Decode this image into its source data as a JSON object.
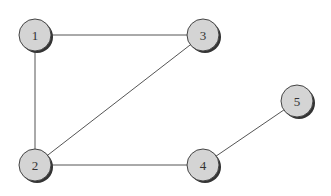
{
  "graph": {
    "nodes": [
      {
        "id": "1",
        "label": "1",
        "x": 35,
        "y": 35
      },
      {
        "id": "2",
        "label": "2",
        "x": 35,
        "y": 165
      },
      {
        "id": "3",
        "label": "3",
        "x": 203,
        "y": 35
      },
      {
        "id": "4",
        "label": "4",
        "x": 203,
        "y": 165
      },
      {
        "id": "5",
        "label": "5",
        "x": 297,
        "y": 101
      }
    ],
    "edges": [
      {
        "from": "1",
        "to": "3"
      },
      {
        "from": "1",
        "to": "2"
      },
      {
        "from": "2",
        "to": "3"
      },
      {
        "from": "2",
        "to": "4"
      },
      {
        "from": "4",
        "to": "5"
      }
    ],
    "colors": {
      "node_fill": "#d4d4d4",
      "node_stroke": "#444444",
      "shadow": "#333333",
      "edge": "#555555"
    }
  }
}
